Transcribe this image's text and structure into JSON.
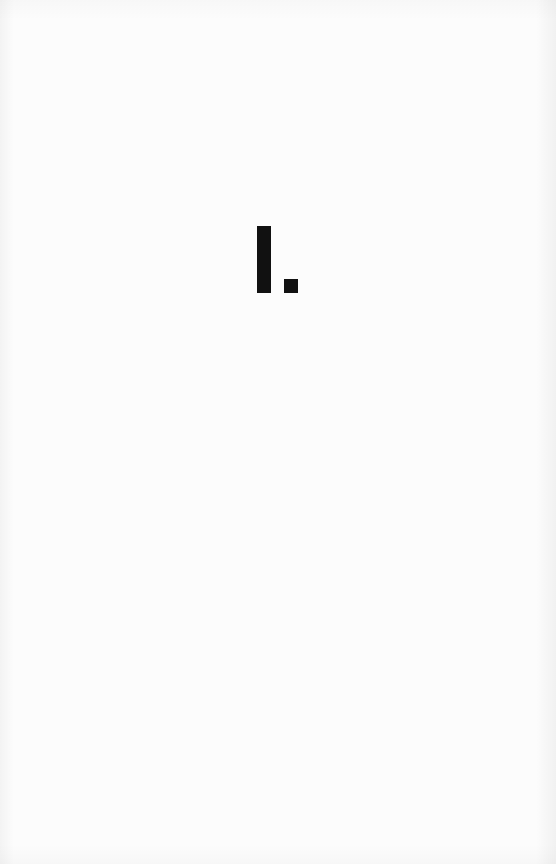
{
  "page": {
    "type": "chapter-opener",
    "background_color": "#fcfcfc",
    "ink_color": "#111111"
  },
  "chapter": {
    "numeral": "I."
  }
}
